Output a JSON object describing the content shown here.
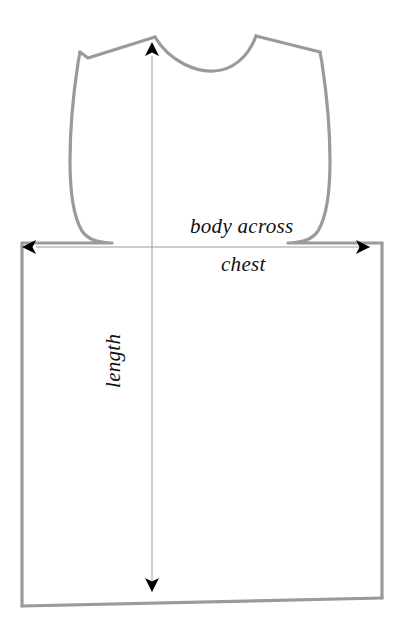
{
  "diagram": {
    "background_color": "#ffffff",
    "outline_color": "#9a9a9a",
    "outline_width": 3,
    "arrow_color": "#8a8a8a",
    "arrowhead_color": "#000000",
    "text_color": "#111111",
    "labels": {
      "body_across": "body across",
      "chest": "chest",
      "length": "length"
    },
    "measurements": [
      {
        "name": "body-across-chest",
        "label_line_1": "body across",
        "label_line_2": "chest",
        "orientation": "horizontal",
        "double_headed": true,
        "from_x": 28,
        "to_x": 378,
        "y": 247,
        "pixel_length": 350
      },
      {
        "name": "length",
        "label_line_1": "length",
        "orientation": "vertical",
        "double_headed": true,
        "x": 152,
        "from_y": 45,
        "to_y": 602,
        "pixel_length": 557
      }
    ],
    "outline_geometry": {
      "neck_left_x": 155,
      "neck_right_x": 256,
      "neck_top_y": 36,
      "neck_bottom_y": 58,
      "shoulder_left": [
        88,
        58
      ],
      "shoulder_right": [
        320,
        52
      ],
      "body_left_x": 22,
      "body_right_x": 382,
      "underarm_left_y": 243,
      "underarm_right_y": 241,
      "hem_left_y": 606,
      "hem_right_y": 598
    }
  }
}
